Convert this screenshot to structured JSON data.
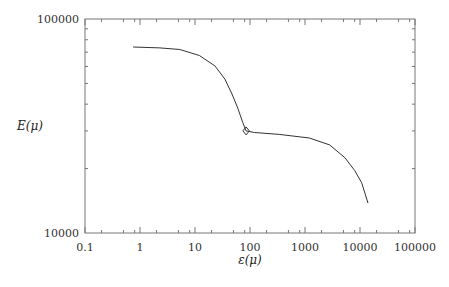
{
  "chart_data": {
    "type": "line",
    "title": "",
    "xlabel": "ε(μ)",
    "ylabel": "E(μ)",
    "xscale": "log",
    "yscale": "log",
    "xlim": [
      0.1,
      100000
    ],
    "ylim": [
      10000,
      100000
    ],
    "grid": false,
    "legend": null,
    "x_ticks": [
      "0.1",
      "1",
      "10",
      "100",
      "1000",
      "10000",
      "100000"
    ],
    "y_ticks": [
      "10000",
      "100000"
    ],
    "series": [
      {
        "name": "E(μ)",
        "x": [
          0.75,
          2.3,
          5.3,
          12,
          23,
          35,
          47,
          60,
          74,
          85,
          120,
          340,
          1200,
          2800,
          5300,
          8000,
          10700,
          14000
        ],
        "y": [
          74000,
          73300,
          72000,
          67500,
          60400,
          52400,
          44600,
          38300,
          32800,
          30000,
          29500,
          28900,
          27800,
          25800,
          22500,
          19600,
          17200,
          13800
        ]
      }
    ],
    "annotations": [
      {
        "type": "marker",
        "shape": "diamond",
        "x": 85,
        "y": 30000
      }
    ]
  }
}
